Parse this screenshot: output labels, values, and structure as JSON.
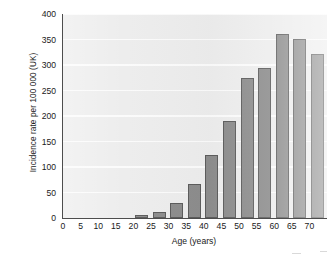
{
  "chart_data": {
    "type": "bar",
    "title": "",
    "xlabel": "Age (years)",
    "ylabel": "Incidence rate per 100 000 (UK)",
    "categories": [
      0,
      5,
      10,
      15,
      20,
      25,
      30,
      35,
      40,
      45,
      50,
      55,
      60,
      65,
      70
    ],
    "values": [
      0,
      0,
      0,
      0,
      5,
      11,
      29,
      67,
      124,
      191,
      274,
      295,
      361,
      351,
      321
    ],
    "x_tick_labels": [
      "0",
      "5",
      "10",
      "15",
      "20",
      "25",
      "30",
      "35",
      "40",
      "45",
      "50",
      "55",
      "60",
      "65",
      "70"
    ],
    "y_tick_labels": [
      "0",
      "50",
      "100",
      "150",
      "200",
      "250",
      "300",
      "350",
      "400"
    ],
    "y_ticks": [
      0,
      50,
      100,
      150,
      200,
      250,
      300,
      350,
      400
    ],
    "ylim": [
      0,
      400
    ],
    "xlim": [
      0,
      75
    ],
    "grid": true,
    "grid_axis": "y",
    "legend": false,
    "legend_position": "none",
    "bar_color": "#8d8d8d",
    "bar_edge_color": "#5c5c5c",
    "plot_background": "#ededed",
    "axis_color": "#4d4d4d",
    "gridline_color": "#fbfbfb"
  }
}
